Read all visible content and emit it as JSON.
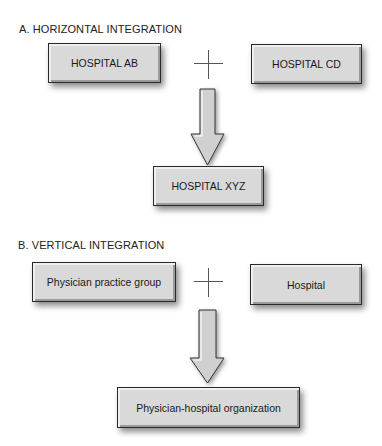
{
  "sections": {
    "horizontal": {
      "heading": "A.  HORIZONTAL INTEGRATION",
      "left_box": "HOSPITAL AB",
      "right_box": "HOSPITAL CD",
      "result_box": "HOSPITAL XYZ"
    },
    "vertical": {
      "heading": "B.  VERTICAL INTEGRATION",
      "left_box": "Physician practice group",
      "right_box": "Hospital",
      "result_box": "Physician-hospital organization"
    }
  },
  "symbols": {
    "combine": "plus-icon",
    "result": "down-arrow-icon"
  },
  "colors": {
    "box_fill": "#d9d9d9",
    "box_border": "#2a2a2a",
    "arrow_fill": "#d0d0d0",
    "background": "#ffffff"
  }
}
